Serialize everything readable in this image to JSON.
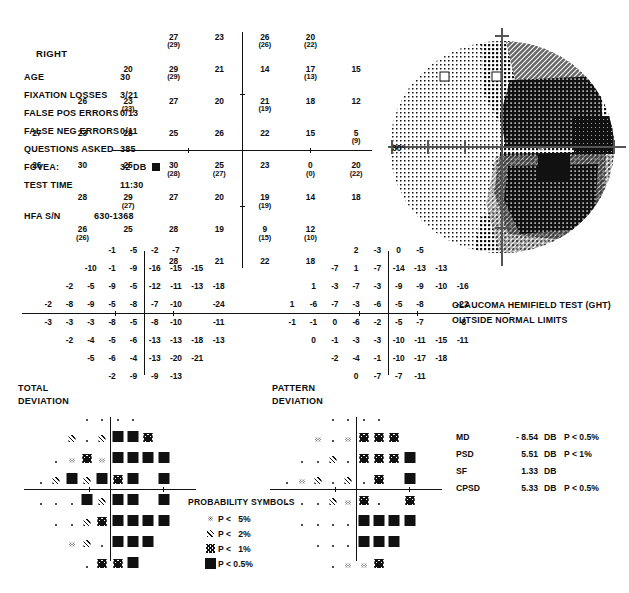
{
  "report": {
    "eye": "RIGHT",
    "fields": [
      {
        "label": "AGE",
        "value": "30"
      },
      {
        "label": "FIXATION LOSSES",
        "value": "3/21"
      },
      {
        "label": "FALSE POS ERRORS",
        "value": "0/13"
      },
      {
        "label": "FALSE NEG ERRORS",
        "value": "0/11"
      },
      {
        "label": "QUESTIONS ASKED",
        "value": "385"
      },
      {
        "label": "FOVEA:",
        "value": "32 DB"
      },
      {
        "label": "TEST TIME",
        "value": "11:30"
      }
    ],
    "serial_label": "HFA S/N",
    "serial_value": "630-1368",
    "degree_label": "30°"
  },
  "ght": {
    "line1": "GLAUCOMA HEMIFIELD TEST (GHT)",
    "line2": "OUTSIDE NORMAL LIMITS"
  },
  "captions": {
    "total_deviation": "TOTAL\nDEVIATION",
    "pattern_deviation": "PATTERN\nDEVIATION"
  },
  "indices": {
    "rows": [
      {
        "key": "MD",
        "value": "- 8.54",
        "unit": "DB",
        "p": "P < 0.5%"
      },
      {
        "key": "PSD",
        "value": "5.51",
        "unit": "DB",
        "p": "P <   1%"
      },
      {
        "key": "SF",
        "value": "1.33",
        "unit": "DB",
        "p": ""
      },
      {
        "key": "CPSD",
        "value": "5.33",
        "unit": "DB",
        "p": "P < 0.5%"
      }
    ]
  },
  "probability_legend": {
    "title": "PROBABILITY SYMBOLS",
    "items": [
      {
        "symbol": "p5",
        "label": "P <   5%"
      },
      {
        "symbol": "p2",
        "label": "P <   2%"
      },
      {
        "symbol": "p1",
        "label": "P <   1%"
      },
      {
        "symbol": "p05",
        "label": "P < 0.5%"
      }
    ]
  },
  "chart_data": {
    "type": "table",
    "sensitivity_plot": {
      "name": "Threshold sensitivity values (dB)",
      "note": "Values in parentheses are retest values at the same location",
      "points": [
        {
          "x": -9,
          "y": 21,
          "v": 27,
          "retest": 29
        },
        {
          "x": -3,
          "y": 21,
          "v": 23,
          "retest": null
        },
        {
          "x": 3,
          "y": 21,
          "v": 26,
          "retest": 26
        },
        {
          "x": 9,
          "y": 21,
          "v": 20,
          "retest": 22
        },
        {
          "x": -15,
          "y": 15,
          "v": 20,
          "retest": null
        },
        {
          "x": -9,
          "y": 15,
          "v": 29,
          "retest": 29
        },
        {
          "x": -3,
          "y": 15,
          "v": 21,
          "retest": null
        },
        {
          "x": 3,
          "y": 15,
          "v": 14,
          "retest": null
        },
        {
          "x": 9,
          "y": 15,
          "v": 17,
          "retest": 13
        },
        {
          "x": 15,
          "y": 15,
          "v": 15,
          "retest": null
        },
        {
          "x": -21,
          "y": 9,
          "v": 26,
          "retest": null
        },
        {
          "x": -15,
          "y": 9,
          "v": 23,
          "retest": 23
        },
        {
          "x": -9,
          "y": 9,
          "v": 27,
          "retest": null
        },
        {
          "x": -3,
          "y": 9,
          "v": 20,
          "retest": null
        },
        {
          "x": 3,
          "y": 9,
          "v": 21,
          "retest": 19
        },
        {
          "x": 9,
          "y": 9,
          "v": 18,
          "retest": null
        },
        {
          "x": 15,
          "y": 9,
          "v": 12,
          "retest": null
        },
        {
          "x": -27,
          "y": 3,
          "v": 27,
          "retest": null
        },
        {
          "x": -21,
          "y": 3,
          "v": 23,
          "retest": null
        },
        {
          "x": -15,
          "y": 3,
          "v": 28,
          "retest": null
        },
        {
          "x": -9,
          "y": 3,
          "v": 25,
          "retest": null
        },
        {
          "x": -3,
          "y": 3,
          "v": 26,
          "retest": null
        },
        {
          "x": 3,
          "y": 3,
          "v": 22,
          "retest": null
        },
        {
          "x": 9,
          "y": 3,
          "v": 15,
          "retest": null
        },
        {
          "x": 15,
          "y": 3,
          "v": 5,
          "retest": 9
        },
        {
          "x": -27,
          "y": -3,
          "v": 26,
          "retest": null
        },
        {
          "x": -21,
          "y": -3,
          "v": 30,
          "retest": null
        },
        {
          "x": -15,
          "y": -3,
          "v": 25,
          "retest": null
        },
        {
          "x": -9,
          "y": -3,
          "v": 30,
          "retest": 28
        },
        {
          "x": -3,
          "y": -3,
          "v": 25,
          "retest": 27
        },
        {
          "x": 3,
          "y": -3,
          "v": 23,
          "retest": null
        },
        {
          "x": 9,
          "y": -3,
          "v": 0,
          "retest": 0
        },
        {
          "x": 15,
          "y": -3,
          "v": 20,
          "retest": 22
        },
        {
          "x": -21,
          "y": -9,
          "v": 28,
          "retest": null
        },
        {
          "x": -15,
          "y": -9,
          "v": 29,
          "retest": 27
        },
        {
          "x": -9,
          "y": -9,
          "v": 27,
          "retest": null
        },
        {
          "x": -3,
          "y": -9,
          "v": 20,
          "retest": null
        },
        {
          "x": 3,
          "y": -9,
          "v": 19,
          "retest": 19
        },
        {
          "x": 9,
          "y": -9,
          "v": 14,
          "retest": null
        },
        {
          "x": 15,
          "y": -9,
          "v": 18,
          "retest": null
        },
        {
          "x": -21,
          "y": -15,
          "v": 26,
          "retest": 26
        },
        {
          "x": -15,
          "y": -15,
          "v": 25,
          "retest": null
        },
        {
          "x": -9,
          "y": -15,
          "v": 28,
          "retest": null
        },
        {
          "x": -3,
          "y": -15,
          "v": 19,
          "retest": null
        },
        {
          "x": 3,
          "y": -15,
          "v": 9,
          "retest": 15
        },
        {
          "x": 9,
          "y": -15,
          "v": 12,
          "retest": 10
        },
        {
          "x": -9,
          "y": -21,
          "v": 28,
          "retest": null
        },
        {
          "x": -3,
          "y": -21,
          "v": 21,
          "retest": null
        },
        {
          "x": 3,
          "y": -21,
          "v": 22,
          "retest": null
        },
        {
          "x": 9,
          "y": -21,
          "v": 18,
          "retest": null
        }
      ]
    },
    "total_deviation_numeric": {
      "name": "Total deviation (dB)",
      "rows": [
        {
          "y": 21,
          "xs": [
            -9,
            -3,
            3,
            9
          ],
          "values": [
            -1,
            -5,
            -2,
            -7
          ]
        },
        {
          "y": 15,
          "xs": [
            -15,
            -9,
            -3,
            3,
            9,
            15
          ],
          "values": [
            -10,
            -1,
            -9,
            -16,
            -15,
            -15
          ]
        },
        {
          "y": 9,
          "xs": [
            -21,
            -15,
            -9,
            -3,
            3,
            9,
            15,
            21
          ],
          "values": [
            -2,
            -5,
            -9,
            -5,
            -12,
            -11,
            -13,
            -18
          ]
        },
        {
          "y": 3,
          "xs": [
            -27,
            -21,
            -15,
            -9,
            -3,
            3,
            9,
            15,
            21
          ],
          "values": [
            -2,
            -8,
            -9,
            -5,
            -8,
            -7,
            -10,
            null,
            -24
          ]
        },
        {
          "y": -3,
          "xs": [
            -27,
            -21,
            -15,
            -9,
            -3,
            3,
            9,
            15,
            21
          ],
          "values": [
            -3,
            -3,
            -3,
            -8,
            -5,
            -8,
            -10,
            null,
            -11
          ]
        },
        {
          "y": -9,
          "xs": [
            -21,
            -15,
            -9,
            -3,
            3,
            9,
            15,
            21
          ],
          "values": [
            -2,
            -4,
            -5,
            -6,
            -13,
            -13,
            -18,
            -13
          ]
        },
        {
          "y": -15,
          "xs": [
            -15,
            -9,
            -3,
            3,
            9,
            15
          ],
          "values": [
            -5,
            -6,
            -4,
            -13,
            -20,
            -21
          ]
        },
        {
          "y": -21,
          "xs": [
            -9,
            -3,
            3,
            9
          ],
          "values": [
            -2,
            -9,
            -9,
            -13
          ]
        }
      ]
    },
    "pattern_deviation_numeric": {
      "name": "Pattern deviation (dB)",
      "rows": [
        {
          "y": 21,
          "xs": [
            -9,
            -3,
            3,
            9
          ],
          "values": [
            2,
            -3,
            0,
            -5
          ]
        },
        {
          "y": 15,
          "xs": [
            -15,
            -9,
            -3,
            3,
            9,
            15
          ],
          "values": [
            -7,
            1,
            -7,
            -14,
            -13,
            -13
          ]
        },
        {
          "y": 9,
          "xs": [
            -21,
            -15,
            -9,
            -3,
            3,
            9,
            15,
            21
          ],
          "values": [
            1,
            -3,
            -7,
            -3,
            -9,
            -9,
            -10,
            -16
          ]
        },
        {
          "y": 3,
          "xs": [
            -27,
            -21,
            -15,
            -9,
            -3,
            3,
            9,
            15,
            21
          ],
          "values": [
            1,
            -6,
            -7,
            -3,
            -6,
            -5,
            -8,
            null,
            -22
          ]
        },
        {
          "y": -3,
          "xs": [
            -27,
            -21,
            -15,
            -9,
            -3,
            3,
            9,
            15,
            21
          ],
          "values": [
            -1,
            -1,
            0,
            -6,
            -2,
            -5,
            -7,
            null,
            -8
          ]
        },
        {
          "y": -9,
          "xs": [
            -21,
            -15,
            -9,
            -3,
            3,
            9,
            15,
            21
          ],
          "values": [
            0,
            -1,
            -3,
            -3,
            -10,
            -11,
            -15,
            -11
          ]
        },
        {
          "y": -15,
          "xs": [
            -15,
            -9,
            -3,
            3,
            9,
            15
          ],
          "values": [
            -2,
            -4,
            -1,
            -10,
            -17,
            -18
          ]
        },
        {
          "y": -21,
          "xs": [
            -9,
            -3,
            3,
            9
          ],
          "values": [
            0,
            -7,
            -7,
            -11
          ]
        }
      ]
    },
    "total_deviation_probability": {
      "name": "Total deviation probability symbols",
      "legend": [
        "dot",
        "p5",
        "p2",
        "p1",
        "p05"
      ],
      "rows": [
        {
          "y": 21,
          "xs": [
            -9,
            -3,
            3,
            9
          ],
          "symbols": [
            "dot",
            "dot",
            "dot",
            "dot"
          ]
        },
        {
          "y": 15,
          "xs": [
            -15,
            -9,
            -3,
            3,
            9,
            15
          ],
          "symbols": [
            "p2",
            "dot",
            "p2",
            "p05",
            "p05",
            "p1"
          ]
        },
        {
          "y": 9,
          "xs": [
            -21,
            -15,
            -9,
            -3,
            3,
            9,
            15,
            21
          ],
          "symbols": [
            "dot",
            "p5",
            "p1",
            "p5",
            "p05",
            "p05",
            "p05",
            "p05"
          ]
        },
        {
          "y": 3,
          "xs": [
            -27,
            -21,
            -15,
            -9,
            -3,
            3,
            9,
            15,
            21
          ],
          "symbols": [
            "dot",
            "p2",
            "p05",
            "p2",
            "p05",
            "p1",
            "p05",
            null,
            "p05"
          ]
        },
        {
          "y": -3,
          "xs": [
            -27,
            -21,
            -15,
            -9,
            -3,
            3,
            9,
            15,
            21
          ],
          "symbols": [
            "dot",
            "dot",
            "dot",
            "p05",
            "p2",
            "p05",
            "p05",
            null,
            "p05"
          ]
        },
        {
          "y": -9,
          "xs": [
            -21,
            -15,
            -9,
            -3,
            3,
            9,
            15,
            21
          ],
          "symbols": [
            "dot",
            "dot",
            "p2",
            "p1",
            "p05",
            "p05",
            "p05",
            "p05"
          ]
        },
        {
          "y": -15,
          "xs": [
            -15,
            -9,
            -3,
            3,
            9,
            15
          ],
          "symbols": [
            "p5",
            "p2",
            "dot",
            "p05",
            "p05",
            "p05"
          ]
        },
        {
          "y": -21,
          "xs": [
            -9,
            -3,
            3,
            9
          ],
          "symbols": [
            "dot",
            "p1",
            "p1",
            "p05"
          ]
        }
      ]
    },
    "pattern_deviation_probability": {
      "name": "Pattern deviation probability symbols",
      "legend": [
        "dot",
        "p5",
        "p2",
        "p1",
        "p05"
      ],
      "rows": [
        {
          "y": 21,
          "xs": [
            -9,
            -3,
            3,
            9
          ],
          "symbols": [
            "dot",
            "dot",
            "dot",
            "dot"
          ]
        },
        {
          "y": 15,
          "xs": [
            -15,
            -9,
            -3,
            3,
            9,
            15
          ],
          "symbols": [
            "p5",
            "dot",
            "p5",
            "p1",
            "p1",
            "p1"
          ]
        },
        {
          "y": 9,
          "xs": [
            -21,
            -15,
            -9,
            -3,
            3,
            9,
            15,
            21
          ],
          "symbols": [
            "dot",
            "dot",
            "p2",
            "dot",
            "p1",
            "p1",
            "p1",
            "p05"
          ]
        },
        {
          "y": 3,
          "xs": [
            -27,
            -21,
            -15,
            -9,
            -3,
            3,
            9,
            15,
            21
          ],
          "symbols": [
            "dot",
            "p5",
            "p2",
            "dot",
            "p2",
            "dot",
            "p1",
            null,
            "p05"
          ]
        },
        {
          "y": -3,
          "xs": [
            -27,
            -21,
            -15,
            -9,
            -3,
            3,
            9,
            15,
            21
          ],
          "symbols": [
            "dot",
            "dot",
            "dot",
            "p2",
            "p5",
            "p1",
            "dot",
            null,
            "p1"
          ]
        },
        {
          "y": -9,
          "xs": [
            -21,
            -15,
            -9,
            -3,
            3,
            9,
            15,
            21
          ],
          "symbols": [
            "dot",
            "dot",
            "dot",
            "dot",
            "p05",
            "p05",
            "p05",
            "p05"
          ]
        },
        {
          "y": -15,
          "xs": [
            -15,
            -9,
            -3,
            3,
            9,
            15
          ],
          "symbols": [
            "dot",
            "dot",
            "dot",
            "p05",
            "p05",
            "p05"
          ]
        },
        {
          "y": -21,
          "xs": [
            -9,
            -3,
            3,
            9
          ],
          "symbols": [
            "dot",
            "p5",
            "p5",
            "p1"
          ]
        }
      ]
    },
    "grayscale_map": {
      "name": "Grayscale sensitivity map",
      "description": "Right eye 30-2 grayscale: normal light shading nasally/temporal-superior-left, dense dark shading across the entire right (nasal) half with near-black scotoma adjacent to the blind spot",
      "levels": [
        "white",
        "light-stipple",
        "mid-stipple",
        "dark-hatch",
        "dark",
        "near-black",
        "black"
      ]
    }
  }
}
